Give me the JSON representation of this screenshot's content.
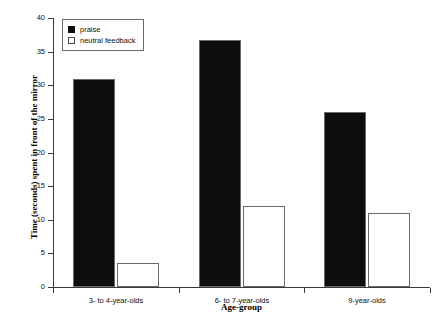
{
  "chart_data": {
    "type": "bar",
    "title": "",
    "xlabel": "Age-group",
    "ylabel": "Time (seconds) spent in front of the mirror",
    "categories": [
      "3- to 4-year-olds",
      "6- to 7-year-olds",
      "9-year-olds"
    ],
    "series": [
      {
        "name": "praise",
        "color": "#0d0d0d",
        "values": [
          31,
          36.7,
          26
        ]
      },
      {
        "name": "neutral feedback",
        "color": "#ffffff",
        "values": [
          3.5,
          12,
          11
        ]
      }
    ],
    "ylim": [
      0,
      40
    ],
    "ytick_values": [
      0,
      5,
      10,
      15,
      20,
      25,
      30,
      35,
      40
    ],
    "ytick_labels": [
      "0",
      "5",
      "10",
      "15",
      "20",
      "25",
      "30",
      "35",
      "40"
    ],
    "grid": false,
    "legend_position": "top-left"
  },
  "legend": {
    "items": [
      {
        "label": "praise",
        "swatch": "filled-square-icon"
      },
      {
        "label": "neutral feedback",
        "swatch": "open-square-icon"
      }
    ]
  }
}
